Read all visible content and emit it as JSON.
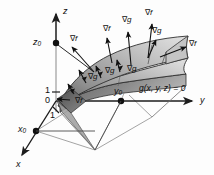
{
  "figure": {
    "width": 214,
    "height": 175,
    "background": "#fdfdfd"
  },
  "axes": {
    "z": {
      "label": "z",
      "x": 63,
      "y": 7,
      "arrow": "up"
    },
    "y": {
      "label": "y",
      "x": 200,
      "y": 101,
      "arrow": "right"
    },
    "x": {
      "label": "x",
      "x": 16,
      "y": 162,
      "arrow": "down-left"
    }
  },
  "points": [
    {
      "name": "z0",
      "label": "z",
      "subscript": "0",
      "x": 33,
      "y": 43
    },
    {
      "name": "x0",
      "label": "x",
      "subscript": "0",
      "x": 20,
      "y": 130
    },
    {
      "name": "y0",
      "label": "y",
      "subscript": "0",
      "x": 114,
      "y": 96
    }
  ],
  "ticks": [
    {
      "name": "tick-z-1",
      "label": "1",
      "x": 45,
      "y": 89
    },
    {
      "name": "tick-z-0",
      "label": "0",
      "x": 45,
      "y": 100
    },
    {
      "name": "tick-y-1",
      "label": "1",
      "x": 50,
      "y": 115
    }
  ],
  "constraint": {
    "label": "g(x, y, z) = 0",
    "x": 139,
    "y": 88
  },
  "gradient_labels": [
    {
      "name": "grad-f-1",
      "symbol": "∇",
      "variable": "f",
      "x": 70,
      "y": 39
    },
    {
      "name": "grad-f-2",
      "symbol": "∇",
      "variable": "f",
      "x": 103,
      "y": 29
    },
    {
      "name": "grad-g-1",
      "symbol": "∇",
      "variable": "g",
      "x": 122,
      "y": 20
    },
    {
      "name": "grad-f-3",
      "symbol": "∇",
      "variable": "f",
      "x": 145,
      "y": 13
    },
    {
      "name": "grad-g-2",
      "symbol": "∇",
      "variable": "g",
      "x": 152,
      "y": 31
    },
    {
      "name": "grad-f-4",
      "symbol": "∇",
      "variable": "f",
      "x": 189,
      "y": 44
    },
    {
      "name": "grad-g-3",
      "symbol": "∇",
      "variable": "g",
      "x": 88,
      "y": 77
    },
    {
      "name": "grad-g-4",
      "symbol": "∇",
      "variable": "g",
      "x": 105,
      "y": 71
    },
    {
      "name": "grad-g-5",
      "symbol": "∇",
      "variable": "g",
      "x": 127,
      "y": 69
    },
    {
      "name": "grad-f-5",
      "symbol": "∇",
      "variable": "f",
      "x": 75,
      "y": 100
    }
  ],
  "colors": {
    "ink": "#101010",
    "axis": "#2a2a2a",
    "axis_light": "#9a9a9a",
    "surface_light": "#c9c9c9",
    "surface_mid": "#9f9f9f",
    "surface_dark": "#6e6e6e",
    "surface_edge": "#3a3a3a",
    "projection": "#8d8d8d",
    "background": "#fdfdfd"
  }
}
